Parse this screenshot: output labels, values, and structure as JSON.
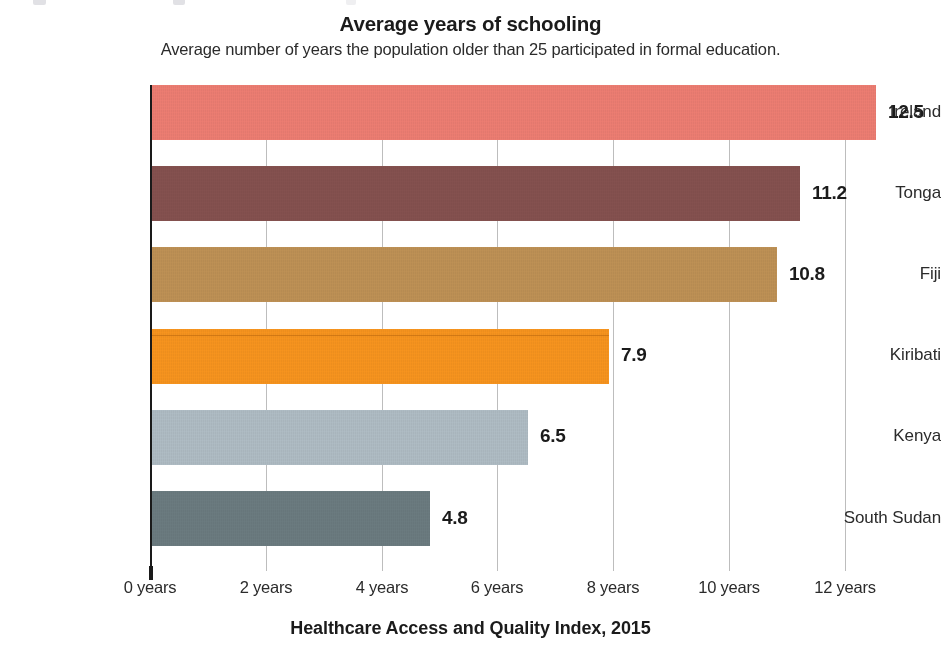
{
  "header": {
    "title": "Average years of schooling",
    "subtitle": "Average number of years the population older than 25 participated in formal education."
  },
  "footer": {
    "title": "Healthcare Access and Quality Index, 2015"
  },
  "chart_data": {
    "type": "bar",
    "orientation": "horizontal",
    "title": "Average years of schooling",
    "subtitle": "Average number of years the population older than 25 participated in formal education.",
    "footer_title": "Healthcare Access and Quality Index, 2015",
    "xlabel": "",
    "ylabel": "",
    "xlim": [
      0,
      13.6
    ],
    "xtick_values": [
      0,
      2,
      4,
      6,
      8,
      10,
      12
    ],
    "xtick_labels": [
      "0 years",
      "2 years",
      "4 years",
      "6 years",
      "8 years",
      "10 years",
      "12 years"
    ],
    "grid": "vertical",
    "legend": "none",
    "value_label_format": "one-decimal",
    "categories": [
      "Ireland",
      "Tonga",
      "Fiji",
      "Kiribati",
      "Kenya",
      "South Sudan"
    ],
    "values": [
      12.5,
      11.2,
      10.8,
      7.9,
      6.5,
      4.8
    ],
    "value_labels": [
      "12.5",
      "11.2",
      "10.8",
      "7.9",
      "6.5",
      "4.8"
    ],
    "colors": [
      "#ED7D72",
      "#85514F",
      "#BE9155",
      "#F7941E",
      "#AFBCC4",
      "#6B7B80"
    ],
    "bars": [
      {
        "category": "Ireland",
        "value": 12.5,
        "label": "12.5",
        "color": "#ED7D72"
      },
      {
        "category": "Tonga",
        "value": 11.2,
        "label": "11.2",
        "color": "#85514F"
      },
      {
        "category": "Fiji",
        "value": 10.8,
        "label": "10.8",
        "color": "#BE9155"
      },
      {
        "category": "Kiribati",
        "value": 7.9,
        "label": "7.9",
        "color": "#F7941E"
      },
      {
        "category": "Kenya",
        "value": 6.5,
        "label": "6.5",
        "color": "#AFBCC4"
      },
      {
        "category": "South Sudan",
        "value": 4.8,
        "label": "4.8",
        "color": "#6B7B80"
      }
    ]
  },
  "style": {
    "axis_color": "#1a1a1a",
    "grid_color": "#bdbdbd",
    "text_color": "#2b2b2b",
    "background": "#ffffff"
  }
}
